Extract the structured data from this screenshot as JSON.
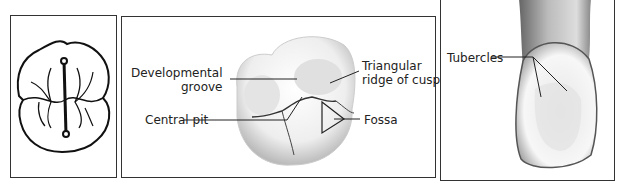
{
  "panels": [
    {
      "id": "occlusal-outline-diagram",
      "labels": []
    },
    {
      "id": "molar-occlusal-surface",
      "labels": {
        "developmental_groove_line1": "Developmental",
        "developmental_groove_line2": "groove",
        "central_pit": "Central pit",
        "triangular_ridge_line1": "Triangular",
        "triangular_ridge_line2": "ridge of cusp",
        "fossa": "Fossa"
      }
    },
    {
      "id": "incisor-lingual-surface",
      "labels": {
        "tubercles": "Tubercles"
      }
    }
  ],
  "colors": {
    "border": "#333333",
    "ink": "#222222",
    "shade": "#cfcfcf"
  }
}
